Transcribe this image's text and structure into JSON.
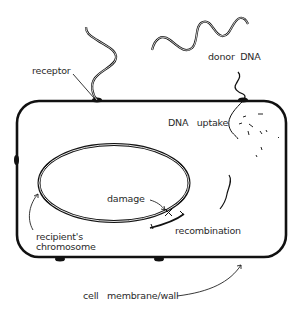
{
  "labels": {
    "receptor": "receptor",
    "donor_dna": "donor  DNA",
    "dna_uptake": "DNA   uptake",
    "damage": "damage",
    "recombination": "recombination",
    "recipients_chromosome_line1": "recipient's",
    "recipients_chromosome_line2": "chromosome",
    "cell_membrane_wall": "cell   membrane/wall"
  },
  "colors": {
    "stroke": "#111111",
    "text": "#2a2a2a",
    "background": "#ffffff"
  }
}
